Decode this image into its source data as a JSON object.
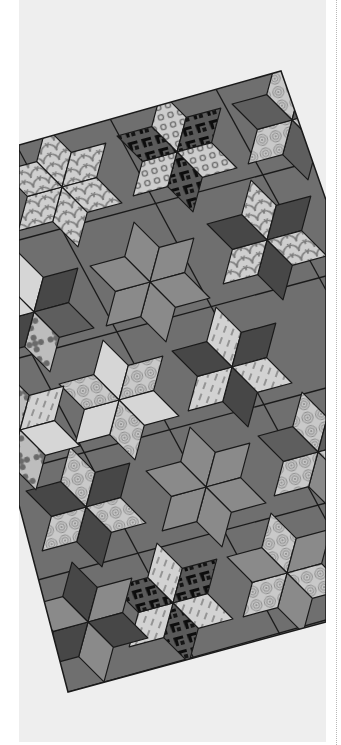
{
  "image": {
    "subject": "Rotated patchwork quilt of six-pointed diamond star hexagon blocks with setting triangles (grayscale)",
    "background_color": "#eeeeee",
    "page_color": "#ffffff",
    "rule_color": "#b8b8b8",
    "quilt": {
      "outline": [
        [
          19,
          145
        ],
        [
          281,
          71
        ],
        [
          326,
          200
        ],
        [
          326,
          622
        ],
        [
          68,
          692
        ],
        [
          19,
          505
        ]
      ],
      "rotation_deg": -15,
      "seam_color": "#1a1a1a",
      "setting_fill": "#6f6f6f",
      "block_radius": 62,
      "colors": {
        "dark": "#474747",
        "medium": "#8a8a8a",
        "medium_dark": "#5e5e5e",
        "light": "#d6d6d6",
        "pattern_light": "#c9c9c9",
        "pattern_ink": "#7a7a7a",
        "fleur_ink": "#0d0d0d"
      },
      "blocks": [
        {
          "name": "scallop-star-top-left",
          "cx": 62,
          "cy": 187,
          "fills": [
            "scallop",
            "scallop",
            "scallop",
            "scallop",
            "scallop",
            "scallop"
          ]
        },
        {
          "name": "fleur-star-top",
          "cx": 177,
          "cy": 152,
          "fills": [
            "dots",
            "fleur",
            "dots",
            "fleur",
            "dots",
            "fleur"
          ]
        },
        {
          "name": "swirl-diamonds-top-right",
          "cx": 292,
          "cy": 120,
          "fills": [
            "swirl",
            "medium_dark",
            "swirl",
            "medium_dark",
            "swirl",
            "medium_dark"
          ]
        },
        {
          "name": "medium-star-center",
          "cx": 150,
          "cy": 282,
          "fills": [
            "medium",
            "medium",
            "medium",
            "medium",
            "medium",
            "medium"
          ]
        },
        {
          "name": "scallop-dark-star-right",
          "cx": 267,
          "cy": 240,
          "fills": [
            "scallop",
            "dark",
            "scallop",
            "dark",
            "scallop",
            "dark"
          ]
        },
        {
          "name": "flower-block-left-edge",
          "cx": 34,
          "cy": 312,
          "fills": [
            "light",
            "dark",
            "medium_dark",
            "flower",
            "dark",
            "light"
          ]
        },
        {
          "name": "light-swirl-cube",
          "cx": 119,
          "cy": 400,
          "fills": [
            "light",
            "swirl",
            "light",
            "swirl",
            "light",
            "swirl"
          ]
        },
        {
          "name": "wavy-star-right",
          "cx": 232,
          "cy": 367,
          "fills": [
            "stripes",
            "dark",
            "stripes",
            "dark",
            "stripes",
            "dark"
          ]
        },
        {
          "name": "swirl-block-right-edge",
          "cx": 318,
          "cy": 452,
          "fills": [
            "swirl",
            "medium_dark",
            "swirl",
            "medium",
            "swirl",
            "medium_dark"
          ]
        },
        {
          "name": "dark-star-lower-left",
          "cx": 86,
          "cy": 507,
          "fills": [
            "swirl",
            "dark",
            "swirl",
            "dark",
            "swirl",
            "dark"
          ]
        },
        {
          "name": "medium-star-lower",
          "cx": 206,
          "cy": 487,
          "fills": [
            "medium",
            "medium",
            "medium",
            "medium",
            "medium",
            "medium"
          ]
        },
        {
          "name": "fleur-star-bottom",
          "cx": 173,
          "cy": 603,
          "fills": [
            "stripes",
            "fleur",
            "stripes",
            "fleur",
            "stripes",
            "fleur"
          ]
        },
        {
          "name": "swirl-medium-bottom-right",
          "cx": 287,
          "cy": 573,
          "fills": [
            "swirl",
            "medium",
            "swirl",
            "medium",
            "swirl",
            "medium"
          ]
        },
        {
          "name": "diamond-column-bottom-left",
          "cx": 88,
          "cy": 622,
          "fills": [
            "dark",
            "medium",
            "dark",
            "medium",
            "dark",
            "medium"
          ]
        },
        {
          "name": "flower-block-lower-left-edge",
          "cx": 20,
          "cy": 430,
          "fills": [
            "flower",
            "stripes",
            "light",
            "flower",
            "stripes",
            "light"
          ]
        }
      ],
      "seam_lines": [
        [
          [
            19,
            240
          ],
          [
            326,
            158
          ]
        ],
        [
          [
            19,
            358
          ],
          [
            326,
            276
          ]
        ],
        [
          [
            19,
            470
          ],
          [
            326,
            388
          ]
        ],
        [
          [
            19,
            585
          ],
          [
            326,
            503
          ]
        ],
        [
          [
            40,
            700
          ],
          [
            326,
            620
          ]
        ],
        [
          [
            100,
            100
          ],
          [
            326,
            520
          ]
        ],
        [
          [
            19,
            150
          ],
          [
            326,
            720
          ]
        ],
        [
          [
            200,
            60
          ],
          [
            326,
            290
          ]
        ],
        [
          [
            19,
            330
          ],
          [
            240,
            745
          ]
        ]
      ]
    }
  }
}
